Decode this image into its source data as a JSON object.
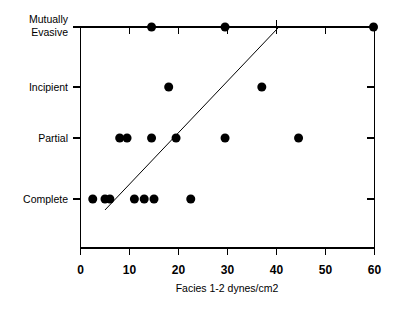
{
  "figure": {
    "background_color": "#ffffff",
    "ink_color": "#000000"
  },
  "chart_data": {
    "type": "scatter",
    "title": "",
    "subtitle": "",
    "xlabel": "Facies 1-2 dynes/cm2",
    "ylabel": "",
    "xlim": [
      0,
      60
    ],
    "xticks": [
      0,
      10,
      20,
      30,
      40,
      50,
      60
    ],
    "xticklabels": [
      "0",
      "10",
      "20",
      "30",
      "40",
      "50",
      "60"
    ],
    "ylim": [
      0,
      3
    ],
    "yticks": [
      0,
      1,
      2,
      3
    ],
    "yticklabels": [
      "Complete",
      "Partial",
      "Incipient",
      "Mutually Evasive"
    ],
    "ycategories": [
      {
        "index": 0,
        "label_line1": "Complete",
        "label_line2": ""
      },
      {
        "index": 1,
        "label_line1": "Partial",
        "label_line2": ""
      },
      {
        "index": 2,
        "label_line1": "Incipient",
        "label_line2": ""
      },
      {
        "index": 3,
        "label_line1": "Mutually",
        "label_line2": "Evasive"
      }
    ],
    "grid": false,
    "legend": null,
    "marker": {
      "shape": "circle",
      "color": "#000000",
      "size_px": 9
    },
    "points": [
      {
        "x": 2.5,
        "y": 0,
        "category": "Complete"
      },
      {
        "x": 5.0,
        "y": 0,
        "category": "Complete"
      },
      {
        "x": 6.0,
        "y": 0,
        "category": "Complete"
      },
      {
        "x": 11.0,
        "y": 0,
        "category": "Complete"
      },
      {
        "x": 13.0,
        "y": 0,
        "category": "Complete"
      },
      {
        "x": 15.0,
        "y": 0,
        "category": "Complete"
      },
      {
        "x": 22.5,
        "y": 0,
        "category": "Complete"
      },
      {
        "x": 8.0,
        "y": 1,
        "category": "Partial"
      },
      {
        "x": 9.5,
        "y": 1,
        "category": "Partial"
      },
      {
        "x": 14.5,
        "y": 1,
        "category": "Partial"
      },
      {
        "x": 19.5,
        "y": 1,
        "category": "Partial"
      },
      {
        "x": 29.5,
        "y": 1,
        "category": "Partial"
      },
      {
        "x": 44.5,
        "y": 1,
        "category": "Partial"
      },
      {
        "x": 18.0,
        "y": 2,
        "category": "Incipient"
      },
      {
        "x": 37.0,
        "y": 2,
        "category": "Incipient"
      },
      {
        "x": 14.5,
        "y": 3,
        "category": "Mutually Evasive"
      },
      {
        "x": 29.5,
        "y": 3,
        "category": "Mutually Evasive"
      },
      {
        "x": 59.8,
        "y": 3,
        "category": "Mutually Evasive"
      }
    ],
    "annotations": [
      {
        "name": "trend-line",
        "type": "line",
        "x_start": 5.0,
        "y_start": -0.18,
        "x_end": 40.5,
        "y_end": 3.0
      }
    ]
  }
}
